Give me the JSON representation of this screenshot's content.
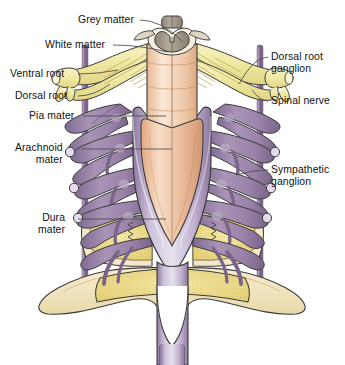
{
  "figure": {
    "background_color": "#ffffff",
    "width": 345,
    "height": 365
  },
  "palette": {
    "nerve_root_yellow": "#f2ecae",
    "nerve_root_yellow_dark": "#ddd182",
    "dura_purple": "#9a82a9",
    "dura_purple_dark": "#6f5a80",
    "dura_purple_light": "#c3b2cd",
    "cord_peach": "#f6d9c0",
    "cord_peach_dark": "#e0a97f",
    "cord_cream": "#f8eede",
    "grey_matter": "#a49a8c",
    "grey_matter_dark": "#7c7266",
    "bone_cream": "#f2e4c4",
    "bone_yellow": "#efdf95",
    "bone_speckle": "#d8c25c",
    "outline": "#3b3b3b",
    "leader_line": "#4a4a4a",
    "text": "#111111"
  },
  "labels": {
    "left": [
      {
        "id": "grey-matter",
        "text": "Grey matter",
        "lines": [
          "Grey matter"
        ],
        "x": 78,
        "y": 14,
        "leader": {
          "x1": 140,
          "y1": 20,
          "x2": 182,
          "y2": 41
        }
      },
      {
        "id": "white-matter",
        "text": "White matter",
        "lines": [
          "White matter"
        ],
        "x": 45,
        "y": 39,
        "leader": {
          "x1": 113,
          "y1": 45,
          "x2": 167,
          "y2": 52
        }
      },
      {
        "id": "ventral-root",
        "text": "Ventral root",
        "lines": [
          "Ventral root"
        ],
        "x": 10,
        "y": 68,
        "leader": {
          "x1": 78,
          "y1": 74,
          "x2": 118,
          "y2": 70
        }
      },
      {
        "id": "dorsal-root",
        "text": "Dorsal root",
        "lines": [
          "Dorsal root"
        ],
        "x": 15,
        "y": 90,
        "leader": {
          "x1": 78,
          "y1": 96,
          "x2": 110,
          "y2": 84
        }
      },
      {
        "id": "pia-mater",
        "text": "Pia mater",
        "lines": [
          "Pia mater"
        ],
        "x": 29,
        "y": 110,
        "leader": {
          "x1": 83,
          "y1": 116,
          "x2": 166,
          "y2": 116
        }
      },
      {
        "id": "arachnoid-mater",
        "text": "Arachnoid mater",
        "lines": [
          "Arachnoid",
          "mater"
        ],
        "x": 15,
        "y": 142,
        "leader": {
          "x1": 82,
          "y1": 149,
          "x2": 172,
          "y2": 149
        }
      },
      {
        "id": "dura-mater",
        "text": "Dura mater",
        "lines": [
          "Dura",
          "mater"
        ],
        "x": 38,
        "y": 212,
        "leader": {
          "x1": 78,
          "y1": 219,
          "x2": 166,
          "y2": 219
        }
      }
    ],
    "right": [
      {
        "id": "dorsal-root-ganglion",
        "text": "Dorsal root ganglion",
        "lines": [
          "Dorsal root",
          "ganglion"
        ],
        "x": 271,
        "y": 51,
        "leader": {
          "x1": 268,
          "y1": 57,
          "x2": 239,
          "y2": 84
        }
      },
      {
        "id": "spinal-nerve",
        "text": "Spinal nerve",
        "lines": [
          "Spinal nerve"
        ],
        "x": 271,
        "y": 95,
        "leader": {
          "x1": 268,
          "y1": 101,
          "x2": 252,
          "y2": 90
        }
      },
      {
        "id": "sympathetic-ganglion",
        "text": "Sympathetic ganglion",
        "lines": [
          "Sympathetic",
          "ganglion"
        ],
        "x": 271,
        "y": 164,
        "leader": {
          "x1": 268,
          "y1": 170,
          "x2": 236,
          "y2": 175
        }
      }
    ]
  },
  "structures": [
    {
      "id": "vertebral-arch",
      "name": "Vertebral arch / spinous process stump",
      "color": "#a49a8c"
    },
    {
      "id": "grey-matter-shape",
      "name": "Grey matter butterfly",
      "color": "#a49a8c"
    },
    {
      "id": "white-matter-shape",
      "name": "White matter",
      "color": "#f8eede"
    },
    {
      "id": "spinal-cord",
      "name": "Spinal cord",
      "color": "#f6d9c0"
    },
    {
      "id": "conus-medullaris",
      "name": "Conus medullaris",
      "color": "#e8bc9a"
    },
    {
      "id": "dural-sac",
      "name": "Dural sac / filum terminale",
      "color": "#b7a7c4"
    },
    {
      "id": "nerve-roots",
      "name": "Dorsal and ventral nerve rootlets",
      "color": "#f2ecae"
    },
    {
      "id": "dorsal-root-ganglia",
      "name": "Dorsal root ganglia",
      "color": "#f2ecae"
    },
    {
      "id": "sympathetic-trunk",
      "name": "Sympathetic trunk and ganglia",
      "color": "#9a82a9"
    },
    {
      "id": "vertebral-body",
      "name": "Vertebral body (cut, cancellous bone)",
      "color": "#efdf95"
    },
    {
      "id": "sacrum",
      "name": "Sacrum / lower vertebra",
      "color": "#f2e4c4"
    }
  ]
}
